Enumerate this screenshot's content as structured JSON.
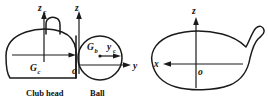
{
  "figure": {
    "background_color": "#ffffff",
    "stroke_color": "#1a1a1a",
    "width": 268,
    "height": 102
  },
  "left_view": {
    "name": "side-view",
    "caption_club": "Club head",
    "caption_ball": "Ball",
    "axes": [
      {
        "id": "zc",
        "symbol": "z",
        "subscript": "c",
        "direction": "up",
        "origin": "club-center"
      },
      {
        "id": "z",
        "symbol": "z",
        "subscript": "",
        "direction": "up",
        "origin": "o"
      },
      {
        "id": "y",
        "symbol": "y",
        "subscript": "",
        "direction": "right",
        "origin": "o"
      },
      {
        "id": "yc",
        "symbol": "y",
        "subscript": "c",
        "direction": "right",
        "origin": "Gb"
      }
    ],
    "points": [
      {
        "id": "Gc",
        "symbol": "G",
        "subscript": "c",
        "meaning": "club head mass center"
      },
      {
        "id": "Gb",
        "symbol": "G",
        "subscript": "b",
        "meaning": "ball mass center"
      },
      {
        "id": "o",
        "symbol": "o",
        "subscript": "",
        "meaning": "origin at impact point"
      }
    ]
  },
  "right_view": {
    "name": "top-view",
    "axes": [
      {
        "id": "z",
        "symbol": "z",
        "subscript": "",
        "direction": "up",
        "origin": "o"
      },
      {
        "id": "x",
        "symbol": "x",
        "subscript": "",
        "direction": "left",
        "origin": "o"
      }
    ],
    "points": [
      {
        "id": "o",
        "symbol": "o",
        "subscript": "",
        "meaning": "origin"
      }
    ]
  },
  "labels": {
    "zc_sym": "z",
    "zc_sub": "c",
    "z_left": "z",
    "y_left": "y",
    "yc_sym": "y",
    "yc_sub": "c",
    "Gc_sym": "G",
    "Gc_sub": "c",
    "Gb_sym": "G",
    "Gb_sub": "b",
    "o_left": "o",
    "club_head_caption": "Club head",
    "ball_caption": "Ball",
    "z_right": "z",
    "x_right": "x",
    "o_right": "o"
  }
}
